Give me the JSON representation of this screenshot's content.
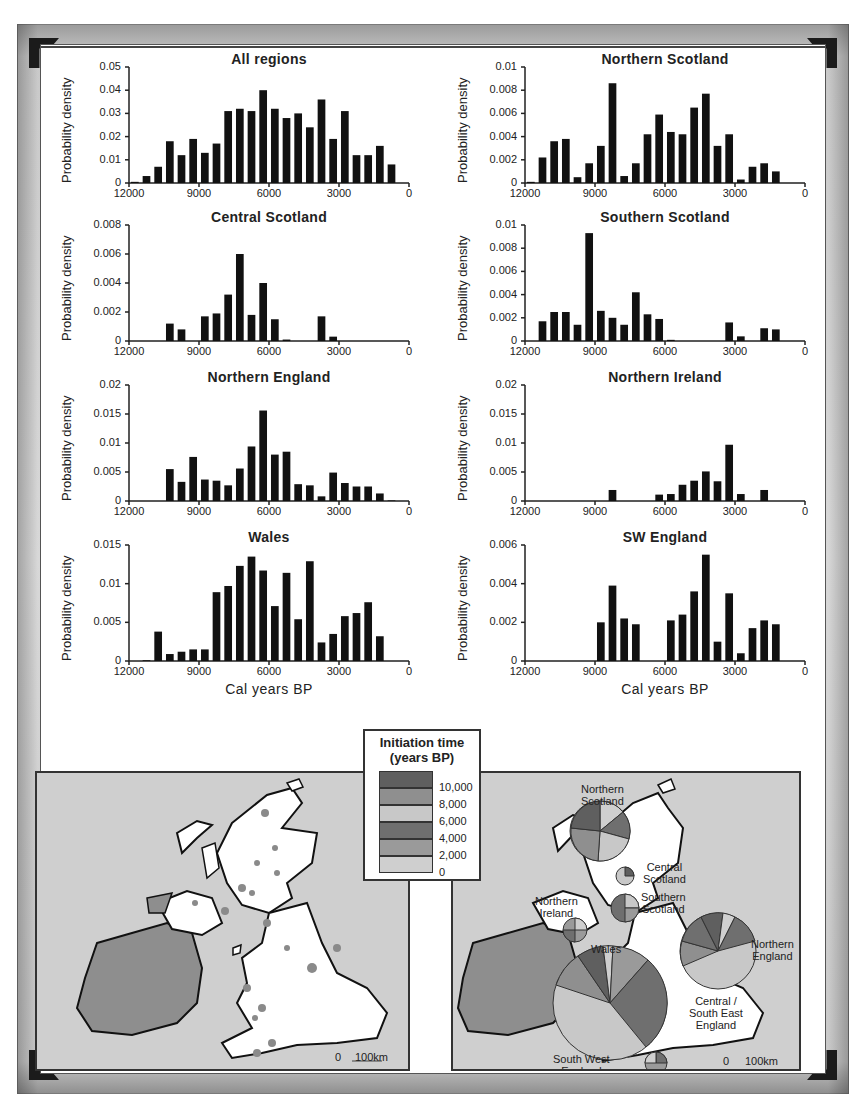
{
  "chart_data": [
    {
      "type": "bar",
      "title": "All regions",
      "xlabel": "",
      "ylabel": "Probability density",
      "xlim": [
        12000,
        0
      ],
      "ylim": [
        0,
        0.05
      ],
      "yticks": [
        "0",
        "0.01",
        "0.02",
        "0.03",
        "0.04",
        "0.05"
      ],
      "xticks": [
        "12000",
        "9000",
        "6000",
        "3000",
        "0"
      ],
      "bin_width": 500,
      "x": [
        11750,
        11250,
        10750,
        10250,
        9750,
        9250,
        8750,
        8250,
        7750,
        7250,
        6750,
        6250,
        5750,
        5250,
        4750,
        4250,
        3750,
        3250,
        2750,
        2250,
        1750,
        1250,
        750,
        250
      ],
      "values": [
        0.0005,
        0.003,
        0.007,
        0.018,
        0.012,
        0.019,
        0.013,
        0.017,
        0.031,
        0.032,
        0.031,
        0.04,
        0.032,
        0.028,
        0.03,
        0.024,
        0.036,
        0.019,
        0.031,
        0.012,
        0.012,
        0.016,
        0.008,
        0
      ]
    },
    {
      "type": "bar",
      "title": "Northern Scotland",
      "xlabel": "",
      "ylabel": "Probability density",
      "xlim": [
        12000,
        0
      ],
      "ylim": [
        0,
        0.01
      ],
      "yticks": [
        "0",
        "0.002",
        "0.004",
        "0.006",
        "0.008",
        "0.01"
      ],
      "xticks": [
        "12000",
        "9000",
        "6000",
        "3000",
        "0"
      ],
      "bin_width": 500,
      "x": [
        11750,
        11250,
        10750,
        10250,
        9750,
        9250,
        8750,
        8250,
        7750,
        7250,
        6750,
        6250,
        5750,
        5250,
        4750,
        4250,
        3750,
        3250,
        2750,
        2250,
        1750,
        1250,
        750,
        250
      ],
      "values": [
        0.0001,
        0.0022,
        0.0036,
        0.0038,
        0.0005,
        0.0017,
        0.0032,
        0.0086,
        0.0006,
        0.0017,
        0.0042,
        0.0059,
        0.0044,
        0.0042,
        0.0065,
        0.0077,
        0.0032,
        0.0042,
        0.0003,
        0.0014,
        0.0017,
        0.001,
        0,
        0
      ]
    },
    {
      "type": "bar",
      "title": "Central Scotland",
      "xlabel": "",
      "ylabel": "Probability density",
      "xlim": [
        12000,
        0
      ],
      "ylim": [
        0,
        0.008
      ],
      "yticks": [
        "0",
        "0.002",
        "0.004",
        "0.006",
        "0.008"
      ],
      "xticks": [
        "12000",
        "9000",
        "6000",
        "3000",
        "0"
      ],
      "bin_width": 500,
      "x": [
        11750,
        11250,
        10750,
        10250,
        9750,
        9250,
        8750,
        8250,
        7750,
        7250,
        6750,
        6250,
        5750,
        5250,
        4750,
        4250,
        3750,
        3250,
        2750,
        2250,
        1750,
        1250,
        750,
        250
      ],
      "values": [
        0,
        0,
        0,
        0.0012,
        0.0008,
        0,
        0.0017,
        0.0019,
        0.0032,
        0.006,
        0.0018,
        0.004,
        0.0015,
        0.0001,
        0,
        0,
        0.0017,
        0.0003,
        0,
        0,
        0,
        0,
        0,
        0
      ]
    },
    {
      "type": "bar",
      "title": "Southern Scotland",
      "xlabel": "",
      "ylabel": "Probability density",
      "xlim": [
        12000,
        0
      ],
      "ylim": [
        0,
        0.01
      ],
      "yticks": [
        "0",
        "0.002",
        "0.004",
        "0.006",
        "0.008",
        "0.01"
      ],
      "xticks": [
        "12000",
        "9000",
        "6000",
        "3000",
        "0"
      ],
      "bin_width": 500,
      "x": [
        11750,
        11250,
        10750,
        10250,
        9750,
        9250,
        8750,
        8250,
        7750,
        7250,
        6750,
        6250,
        5750,
        5250,
        4750,
        4250,
        3750,
        3250,
        2750,
        2250,
        1750,
        1250,
        750,
        250
      ],
      "values": [
        0,
        0.0017,
        0.0025,
        0.0025,
        0.0014,
        0.0093,
        0.0026,
        0.002,
        0.0014,
        0.0042,
        0.0023,
        0.0019,
        0.0001,
        0,
        0,
        0,
        0,
        0.0016,
        0.0004,
        0,
        0.0011,
        0.001,
        0,
        0
      ]
    },
    {
      "type": "bar",
      "title": "Northern England",
      "xlabel": "",
      "ylabel": "Probability density",
      "xlim": [
        12000,
        0
      ],
      "ylim": [
        0,
        0.02
      ],
      "yticks": [
        "0",
        "0.005",
        "0.01",
        "0.015",
        "0.02"
      ],
      "xticks": [
        "12000",
        "9000",
        "6000",
        "3000",
        "0"
      ],
      "bin_width": 500,
      "x": [
        11750,
        11250,
        10750,
        10250,
        9750,
        9250,
        8750,
        8250,
        7750,
        7250,
        6750,
        6250,
        5750,
        5250,
        4750,
        4250,
        3750,
        3250,
        2750,
        2250,
        1750,
        1250,
        750,
        250
      ],
      "values": [
        0,
        0,
        0,
        0.0055,
        0.0033,
        0.0076,
        0.0037,
        0.0035,
        0.0027,
        0.0056,
        0.0094,
        0.0156,
        0.008,
        0.0085,
        0.0029,
        0.0027,
        0.0008,
        0.0049,
        0.0031,
        0.0025,
        0.0025,
        0.0013,
        0.0001,
        0
      ]
    },
    {
      "type": "bar",
      "title": "Northern Ireland",
      "xlabel": "",
      "ylabel": "Probability density",
      "xlim": [
        12000,
        0
      ],
      "ylim": [
        0,
        0.02
      ],
      "yticks": [
        "0",
        "0.005",
        "0.01",
        "0.015",
        "0.02"
      ],
      "xticks": [
        "12000",
        "9000",
        "6000",
        "3000",
        "0"
      ],
      "bin_width": 500,
      "x": [
        11750,
        11250,
        10750,
        10250,
        9750,
        9250,
        8750,
        8250,
        7750,
        7250,
        6750,
        6250,
        5750,
        5250,
        4750,
        4250,
        3750,
        3250,
        2750,
        2250,
        1750,
        1250,
        750,
        250
      ],
      "values": [
        0,
        0,
        0,
        0,
        0,
        0,
        0,
        0.0019,
        0,
        0,
        0,
        0.0011,
        0.0012,
        0.0028,
        0.0035,
        0.0051,
        0.0034,
        0.0097,
        0.0012,
        0,
        0.0019,
        0,
        0,
        0
      ]
    },
    {
      "type": "bar",
      "title": "Wales",
      "xlabel": "Cal years BP",
      "ylabel": "Probability density",
      "xlim": [
        12000,
        0
      ],
      "ylim": [
        0,
        0.015
      ],
      "yticks": [
        "0",
        "0.005",
        "0.01",
        "0.015"
      ],
      "xticks": [
        "12000",
        "9000",
        "6000",
        "3000",
        "0"
      ],
      "bin_width": 500,
      "x": [
        11750,
        11250,
        10750,
        10250,
        9750,
        9250,
        8750,
        8250,
        7750,
        7250,
        6750,
        6250,
        5750,
        5250,
        4750,
        4250,
        3750,
        3250,
        2750,
        2250,
        1750,
        1250,
        750,
        250
      ],
      "values": [
        0,
        0.0001,
        0.0038,
        0.0009,
        0.0012,
        0.0015,
        0.0015,
        0.0089,
        0.0097,
        0.0123,
        0.0135,
        0.0117,
        0.0071,
        0.0114,
        0.0054,
        0.0129,
        0.0024,
        0.0035,
        0.0058,
        0.0062,
        0.0076,
        0.0032,
        0,
        0
      ]
    },
    {
      "type": "bar",
      "title": "SW England",
      "xlabel": "Cal years BP",
      "ylabel": "Probability density",
      "xlim": [
        12000,
        0
      ],
      "ylim": [
        0,
        0.006
      ],
      "yticks": [
        "0",
        "0.002",
        "0.004",
        "0.006"
      ],
      "xticks": [
        "12000",
        "9000",
        "6000",
        "3000",
        "0"
      ],
      "bin_width": 500,
      "x": [
        11750,
        11250,
        10750,
        10250,
        9750,
        9250,
        8750,
        8250,
        7750,
        7250,
        6750,
        6250,
        5750,
        5250,
        4750,
        4250,
        3750,
        3250,
        2750,
        2250,
        1750,
        1250,
        750,
        250
      ],
      "values": [
        0,
        0,
        0,
        0,
        0,
        0,
        0.002,
        0.0039,
        0.0022,
        0.0019,
        0,
        0,
        0.0021,
        0.0024,
        0.0036,
        0.0055,
        0.001,
        0.0035,
        0.0004,
        0.0017,
        0.0021,
        0.0019,
        0,
        0
      ]
    }
  ],
  "legend": {
    "title_line1": "Initiation time",
    "title_line2": "(years BP)",
    "ticks": [
      "10,000",
      "8,000",
      "6,000",
      "4,000",
      "2,000",
      "0"
    ],
    "colors": [
      "#5f5f5f",
      "#8f8f8f",
      "#c8c8c8",
      "#6f6f6f",
      "#9a9a9a",
      "#cfcfcf"
    ]
  },
  "maps": {
    "left": {
      "scale_zero": "0",
      "scale_label": "100km"
    },
    "right": {
      "scale_zero": "0",
      "scale_label": "100km",
      "regions": [
        {
          "label_line1": "Northern",
          "label_line2": "Scotland"
        },
        {
          "label_line1": "Central",
          "label_line2": "Scotland"
        },
        {
          "label_line1": "Southern",
          "label_line2": "Scotland"
        },
        {
          "label_line1": "Northern",
          "label_line2": "Ireland"
        },
        {
          "label_line1": "Northern",
          "label_line2": "England"
        },
        {
          "label_line1": "Wales",
          "label_line2": ""
        },
        {
          "label_line1": "Central /",
          "label_line2": "South East",
          "label_line3": "England"
        },
        {
          "label_line1": "South West",
          "label_line2": "England"
        }
      ]
    }
  },
  "colors": {
    "bar": "#111111",
    "sea": "#cfcfcf",
    "land": "#ffffff",
    "ireland": "#8e8e8e"
  }
}
